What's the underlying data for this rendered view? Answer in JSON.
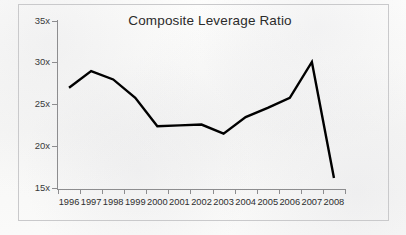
{
  "chart_data": {
    "type": "line",
    "title": "Composite Leverage Ratio",
    "xlabel": "",
    "ylabel": "",
    "categories": [
      "1996",
      "1997",
      "1998",
      "1999",
      "2000",
      "2001",
      "2002",
      "2003",
      "2004",
      "2005",
      "2006",
      "2007",
      "2008"
    ],
    "values": [
      27.0,
      29.0,
      28.0,
      25.8,
      22.4,
      22.5,
      22.6,
      21.5,
      23.5,
      24.6,
      25.8,
      30.1,
      16.2
    ],
    "series": [
      {
        "name": "Composite Leverage Ratio",
        "values": [
          27.0,
          29.0,
          28.0,
          25.8,
          22.4,
          22.5,
          22.6,
          21.5,
          23.5,
          24.6,
          25.8,
          30.1,
          16.2
        ]
      }
    ],
    "ylim": [
      15,
      35
    ],
    "ytick_values": [
      35,
      30,
      25,
      20,
      15
    ],
    "ytick_labels": [
      "35x",
      "30x",
      "25x",
      "20x",
      "15x"
    ],
    "grid": false,
    "legend": false,
    "markers": false,
    "line_color": "#000000",
    "line_width": 2.4,
    "axis_color": "#8d8d8f",
    "background_color": "#fbfbfa",
    "frame_color": "#c9c9cb"
  }
}
